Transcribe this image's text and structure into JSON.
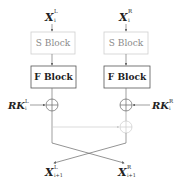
{
  "diagram": {
    "inputs": {
      "left": {
        "base": "X",
        "sup": "L",
        "sub": "i"
      },
      "right": {
        "base": "X",
        "sup": "R",
        "sub": "i"
      }
    },
    "blocks": {
      "left_s": "S Block",
      "right_s": "S Block",
      "left_f": "F Block",
      "right_f": "F Block"
    },
    "round_keys": {
      "left": {
        "base": "RK",
        "sup": "L",
        "sub": "i"
      },
      "right": {
        "base": "RK",
        "sup": "R",
        "sub": "i"
      }
    },
    "outputs": {
      "left": {
        "base": "X",
        "sup": "L",
        "sub": "i+1"
      },
      "right": {
        "base": "X",
        "sup": "R",
        "sub": "i+1"
      }
    },
    "colors": {
      "line": "#777777",
      "faint": "#cccccc",
      "s_block_border": "#cfcfcf",
      "s_block_text": "#8a8a8a",
      "f_block_border": "#555555",
      "f_block_text": "#222222"
    }
  }
}
